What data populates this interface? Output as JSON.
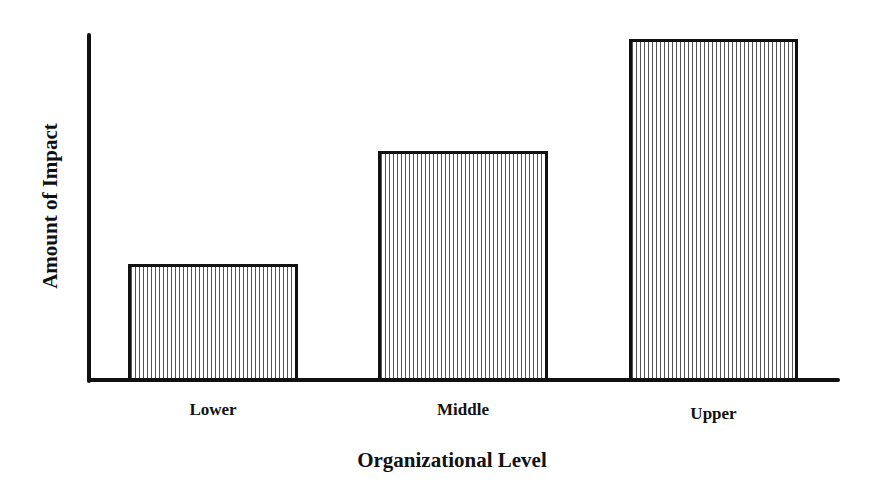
{
  "chart_data": {
    "type": "bar",
    "title": "",
    "xlabel": "Organizational Level",
    "ylabel": "Amount of Impact",
    "categories": [
      "Lower",
      "Middle",
      "Upper"
    ],
    "values": [
      34,
      67,
      100
    ],
    "ylim": [
      0,
      100
    ],
    "grid": false,
    "legend": null,
    "yticks": [],
    "fill_pattern": "vertical-stripes",
    "bar_color": "#ffffff",
    "edge_color": "#111111"
  },
  "bars": [
    {
      "label": "Lower",
      "left": 128,
      "width": 170,
      "top": 264
    },
    {
      "label": "Middle",
      "left": 378,
      "width": 170,
      "top": 151
    },
    {
      "label": "Upper",
      "left": 629,
      "width": 169,
      "top": 39
    }
  ]
}
